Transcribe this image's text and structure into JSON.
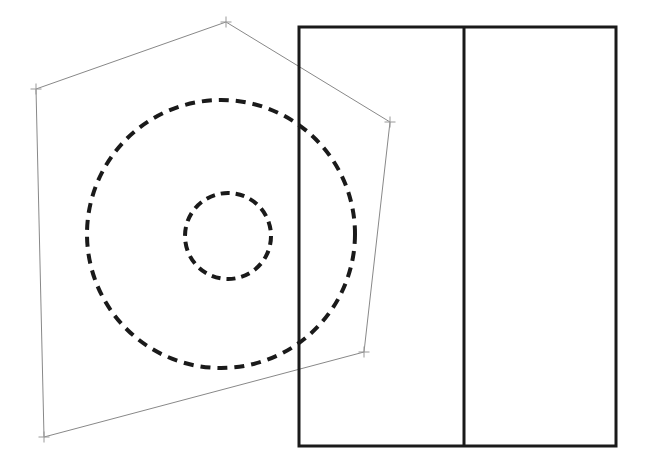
{
  "canvas": {
    "width": 649,
    "height": 468,
    "background": "#ffffff",
    "title": "Technical Drawing - Pentagon with Concentric Dashed Circles and Rectangle"
  },
  "styles": {
    "polygon_stroke": "#888888",
    "polygon_stroke_width": 1,
    "polygon_fill": "none",
    "vertex_marker_stroke": "#999999",
    "vertex_marker_stroke_width": 1,
    "vertex_marker_size": 11,
    "rectangle_stroke": "#1a1a1a",
    "rectangle_stroke_width": 3,
    "rectangle_fill": "none",
    "divider_stroke": "#1a1a1a",
    "divider_stroke_width": 3,
    "circle_stroke": "#1a1a1a",
    "circle_stroke_width": 4,
    "circle_fill": "none",
    "circle_dash_pattern": "10 7",
    "small_circle_dash_pattern": "9 6"
  },
  "shapes": {
    "polygon": {
      "name": "pentagon-outline",
      "points": "36,89 226,22 390,122 364,352 44,437",
      "vertices": [
        {
          "label": "top-left-vertex",
          "x": 36,
          "y": 89
        },
        {
          "label": "apex-vertex",
          "x": 226,
          "y": 22
        },
        {
          "label": "right-upper-vertex",
          "x": 390,
          "y": 122
        },
        {
          "label": "right-lower-vertex",
          "x": 364,
          "y": 352
        },
        {
          "label": "bottom-left-vertex",
          "x": 44,
          "y": 437
        }
      ]
    },
    "rectangle": {
      "name": "main-rectangle",
      "x": 299,
      "y": 27,
      "width": 317,
      "height": 419
    },
    "divider": {
      "name": "vertical-divider",
      "x": 464,
      "y1": 27,
      "y2": 446
    },
    "outer_circle": {
      "name": "outer-dashed-circle",
      "cx": 221,
      "cy": 234,
      "r": 134
    },
    "inner_circle": {
      "name": "inner-dashed-circle",
      "cx": 228,
      "cy": 236,
      "r": 43
    }
  }
}
